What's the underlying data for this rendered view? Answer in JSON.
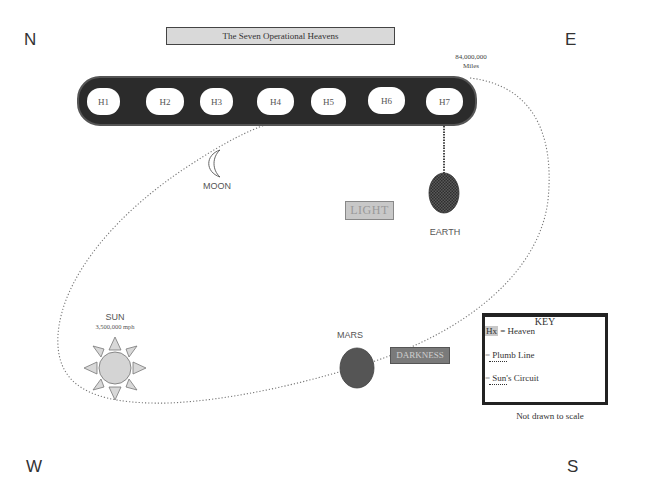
{
  "compass": {
    "north": "N",
    "east": "E",
    "west": "W",
    "south": "S"
  },
  "title": "The Seven Operational Heavens",
  "heavens": [
    "H1",
    "H2",
    "H3",
    "H4",
    "H5",
    "H6",
    "H7"
  ],
  "distance": {
    "value": "84,000,000",
    "unit": "Miles"
  },
  "bodies": {
    "moon": {
      "label": "MOON"
    },
    "earth": {
      "label": "EARTH"
    },
    "sun": {
      "label": "SUN",
      "speed": "3,500,000 mph"
    },
    "mars": {
      "label": "MARS"
    }
  },
  "regions": {
    "light": "LIGHT",
    "darkness": "DARKNESS"
  },
  "key": {
    "title": "KEY",
    "items": [
      {
        "symbol": "Hx",
        "label": "= Heaven"
      },
      {
        "symbol": "=",
        "label": "Plumb Line"
      },
      {
        "symbol": "=",
        "label": "Sun's Circuit"
      }
    ]
  },
  "scale_note": "Not drawn to scale",
  "colors": {
    "heavens_bar": "#2b2b2b",
    "earth": "#4a4a4a",
    "mars": "#555555",
    "sun": "#d4d4d4",
    "title_box": "#d9d9d9",
    "darkness_box": "#7a7a7a",
    "light_box": "#c8c8c8"
  }
}
